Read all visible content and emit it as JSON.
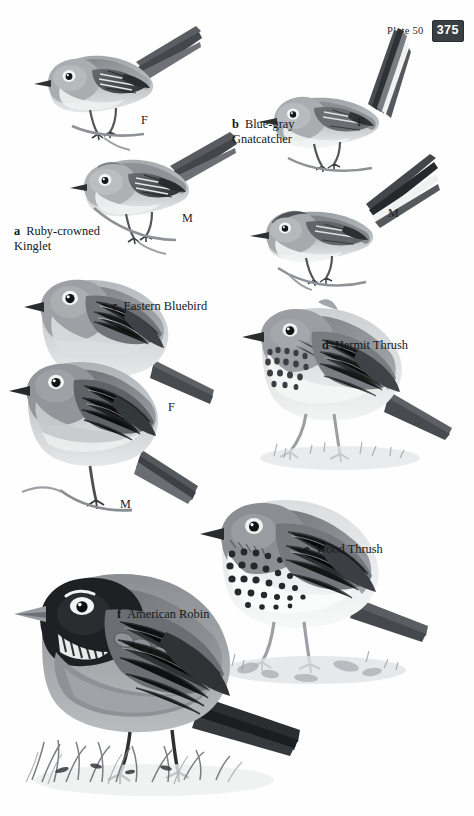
{
  "header": {
    "plate_label": "Plate 50",
    "page_number": "375"
  },
  "palette": {
    "badge_bg": "#3a3f44",
    "badge_text": "#ffffff",
    "ink": "#15181b",
    "paper": "#fefefe",
    "bird_dark": "#4b4f53",
    "bird_mid": "#8d9195",
    "bird_light": "#c9cbcd",
    "bird_pale": "#eceded"
  },
  "species": [
    {
      "key": "a",
      "name": "Ruby-crowned\nKinglet",
      "caption_single_line": "Ruby-crowned Kinglet",
      "marks": [
        "F",
        "M"
      ]
    },
    {
      "key": "b",
      "name": "Blue-gray\nGnatcatcher",
      "caption_single_line": "Blue-gray Gnatcatcher",
      "marks": [
        "F",
        "M"
      ]
    },
    {
      "key": "c",
      "name": "Eastern Bluebird",
      "caption_single_line": "Eastern Bluebird",
      "marks": [
        "F",
        "M"
      ]
    },
    {
      "key": "d",
      "name": "Hermit Thrush",
      "caption_single_line": "Hermit Thrush",
      "marks": []
    },
    {
      "key": "e",
      "name": "Wood Thrush",
      "caption_single_line": "Wood Thrush",
      "marks": []
    },
    {
      "key": "f",
      "name": "American Robin",
      "caption_single_line": "American Robin",
      "marks": []
    }
  ],
  "marks": {
    "kinglet_female": "F",
    "kinglet_male": "M",
    "gnatcatcher_female": "F",
    "gnatcatcher_male": "M",
    "bluebird_female": "F",
    "bluebird_male": "M"
  }
}
